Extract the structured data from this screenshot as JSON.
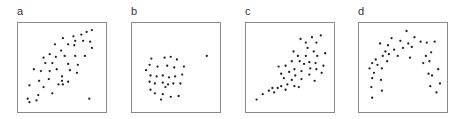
{
  "chart_data": [
    {
      "type": "scatter",
      "title": "a",
      "xlabel": "",
      "ylabel": "",
      "xlim": [
        0,
        100
      ],
      "ylim": [
        0,
        100
      ],
      "grid": false,
      "description": "positive linear correlation with one outlier at lower right",
      "points": [
        [
          84,
          92
        ],
        [
          78,
          90
        ],
        [
          72,
          87
        ],
        [
          63,
          85
        ],
        [
          51,
          83
        ],
        [
          65,
          80
        ],
        [
          74,
          80
        ],
        [
          82,
          79
        ],
        [
          42,
          76
        ],
        [
          57,
          76
        ],
        [
          64,
          75
        ],
        [
          84,
          72
        ],
        [
          49,
          69
        ],
        [
          36,
          65
        ],
        [
          53,
          63
        ],
        [
          65,
          63
        ],
        [
          76,
          63
        ],
        [
          29,
          61
        ],
        [
          43,
          62
        ],
        [
          31,
          55
        ],
        [
          39,
          55
        ],
        [
          57,
          54
        ],
        [
          68,
          53
        ],
        [
          18,
          48
        ],
        [
          26,
          46
        ],
        [
          36,
          46
        ],
        [
          44,
          48
        ],
        [
          59,
          47
        ],
        [
          67,
          44
        ],
        [
          50,
          40
        ],
        [
          35,
          37
        ],
        [
          24,
          35
        ],
        [
          50,
          35
        ],
        [
          57,
          34
        ],
        [
          13,
          30
        ],
        [
          46,
          31
        ],
        [
          51,
          31
        ],
        [
          29,
          28
        ],
        [
          39,
          21
        ],
        [
          23,
          19
        ],
        [
          11,
          15
        ],
        [
          13,
          11
        ],
        [
          21,
          13
        ],
        [
          81,
          15
        ]
      ]
    },
    {
      "type": "scatter",
      "title": "b",
      "xlabel": "",
      "ylabel": "",
      "xlim": [
        0,
        100
      ],
      "ylim": [
        0,
        100
      ],
      "grid": false,
      "description": "uncorrelated circular cluster with one outlier at right",
      "points": [
        [
          22,
          60
        ],
        [
          37,
          61
        ],
        [
          44,
          62
        ],
        [
          51,
          59
        ],
        [
          20,
          53
        ],
        [
          29,
          51
        ],
        [
          40,
          52
        ],
        [
          48,
          50
        ],
        [
          59,
          51
        ],
        [
          16,
          47
        ],
        [
          21,
          41
        ],
        [
          28,
          40
        ],
        [
          35,
          41
        ],
        [
          42,
          39
        ],
        [
          49,
          40
        ],
        [
          57,
          42
        ],
        [
          20,
          34
        ],
        [
          26,
          32
        ],
        [
          35,
          33
        ],
        [
          41,
          31
        ],
        [
          47,
          32
        ],
        [
          55,
          32
        ],
        [
          38,
          28
        ],
        [
          21,
          25
        ],
        [
          26,
          21
        ],
        [
          35,
          20
        ],
        [
          44,
          17
        ],
        [
          33,
          14
        ],
        [
          53,
          18
        ],
        [
          85,
          63
        ]
      ]
    },
    {
      "type": "scatter",
      "title": "c",
      "xlabel": "",
      "ylabel": "",
      "xlim": [
        0,
        100
      ],
      "ylim": [
        0,
        100
      ],
      "grid": false,
      "description": "positive linear correlation without outlier",
      "points": [
        [
          62,
          82
        ],
        [
          75,
          84
        ],
        [
          85,
          86
        ],
        [
          68,
          78
        ],
        [
          80,
          78
        ],
        [
          54,
          68
        ],
        [
          70,
          72
        ],
        [
          77,
          68
        ],
        [
          59,
          63
        ],
        [
          68,
          63
        ],
        [
          81,
          63
        ],
        [
          90,
          66
        ],
        [
          52,
          57
        ],
        [
          61,
          57
        ],
        [
          72,
          56
        ],
        [
          79,
          55
        ],
        [
          66,
          54
        ],
        [
          88,
          52
        ],
        [
          37,
          51
        ],
        [
          45,
          52
        ],
        [
          55,
          48
        ],
        [
          63,
          46
        ],
        [
          73,
          49
        ],
        [
          80,
          48
        ],
        [
          49,
          45
        ],
        [
          40,
          43
        ],
        [
          56,
          41
        ],
        [
          72,
          42
        ],
        [
          86,
          44
        ],
        [
          43,
          38
        ],
        [
          52,
          36
        ],
        [
          63,
          37
        ],
        [
          78,
          35
        ],
        [
          47,
          31
        ],
        [
          40,
          29
        ],
        [
          55,
          29
        ],
        [
          36,
          27
        ],
        [
          60,
          28
        ],
        [
          30,
          27
        ],
        [
          26,
          24
        ],
        [
          19,
          20
        ],
        [
          12,
          14
        ],
        [
          32,
          22
        ],
        [
          45,
          25
        ]
      ]
    },
    {
      "type": "scatter",
      "title": "d",
      "xlabel": "",
      "ylabel": "",
      "xlim": [
        0,
        100
      ],
      "ylim": [
        0,
        100
      ],
      "grid": false,
      "description": "inverted-U (quadratic) relationship",
      "points": [
        [
          54,
          91
        ],
        [
          63,
          84
        ],
        [
          37,
          83
        ],
        [
          47,
          80
        ],
        [
          70,
          79
        ],
        [
          24,
          77
        ],
        [
          33,
          75
        ],
        [
          56,
          77
        ],
        [
          60,
          73
        ],
        [
          77,
          78
        ],
        [
          86,
          79
        ],
        [
          50,
          72
        ],
        [
          40,
          70
        ],
        [
          30,
          68
        ],
        [
          34,
          65
        ],
        [
          76,
          63
        ],
        [
          82,
          67
        ],
        [
          27,
          63
        ],
        [
          44,
          63
        ],
        [
          58,
          61
        ],
        [
          19,
          59
        ],
        [
          15,
          55
        ],
        [
          21,
          53
        ],
        [
          32,
          57
        ],
        [
          73,
          55
        ],
        [
          80,
          57
        ],
        [
          26,
          49
        ],
        [
          12,
          49
        ],
        [
          17,
          44
        ],
        [
          79,
          43
        ],
        [
          83,
          41
        ],
        [
          90,
          48
        ],
        [
          15,
          38
        ],
        [
          25,
          36
        ],
        [
          92,
          32
        ],
        [
          81,
          29
        ],
        [
          14,
          28
        ],
        [
          26,
          24
        ],
        [
          88,
          22
        ],
        [
          15,
          16
        ]
      ]
    }
  ],
  "panels": [
    {
      "label": "a"
    },
    {
      "label": "b"
    },
    {
      "label": "c"
    },
    {
      "label": "d"
    }
  ],
  "style": {
    "dot_color": "#222222",
    "frame_color": "#8a8a8a"
  }
}
